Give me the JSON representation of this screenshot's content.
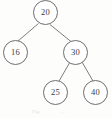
{
  "figure": {
    "kind": "binary-search-tree-diagram",
    "background_color": "#fdfdfc",
    "stroke_color": "#6e6e70",
    "text_color": "#3a3a3c"
  },
  "tree": {
    "nodes": [
      {
        "id": "root",
        "label": "20",
        "x": 33,
        "y": 0,
        "size": 25
      },
      {
        "id": "left",
        "label": "16",
        "x": 3,
        "y": 40,
        "size": 25
      },
      {
        "id": "right",
        "label": "30",
        "x": 63,
        "y": 40,
        "size": 25
      },
      {
        "id": "right-left",
        "label": "25",
        "x": 43,
        "y": 80,
        "size": 25
      },
      {
        "id": "right-right",
        "label": "40",
        "x": 83,
        "y": 80,
        "size": 25
      }
    ],
    "edges": [
      {
        "id": "edge-root-left",
        "x1": 38.5,
        "y1": 23.5,
        "x2": 18,
        "y2": 41
      },
      {
        "id": "edge-root-right",
        "x1": 50,
        "y1": 24.5,
        "x2": 71.5,
        "y2": 42
      },
      {
        "id": "edge-right-left",
        "x1": 70,
        "y1": 62,
        "x2": 58.5,
        "y2": 82
      },
      {
        "id": "edge-right-right",
        "x1": 82,
        "y1": 62,
        "x2": 93,
        "y2": 81
      }
    ]
  },
  "caption": {
    "left_fragment": "Fig.",
    "right_fragment": "…"
  }
}
